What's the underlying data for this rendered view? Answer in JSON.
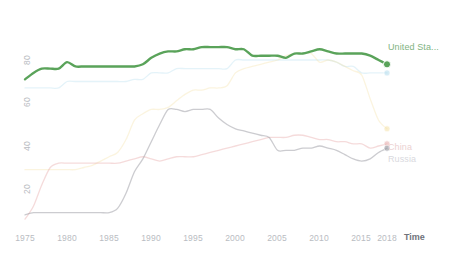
{
  "chart_data": {
    "type": "line",
    "title": "",
    "subtitle": "",
    "xlabel": "Time",
    "ylabel": "",
    "xlim": [
      1975,
      2018
    ],
    "ylim": [
      0,
      92
    ],
    "grid": false,
    "legend_position": "right",
    "x_ticks": [
      1975,
      1980,
      1985,
      1990,
      1995,
      2000,
      2005,
      2010,
      2015,
      2018
    ],
    "x_tick_labels": [
      "1975",
      "1980",
      "1985",
      "1990",
      "1995",
      "2000",
      "2005",
      "2010",
      "2015",
      "2018"
    ],
    "y_ticks": [
      20,
      40,
      60,
      80
    ],
    "y_tick_labels": [
      "20",
      "40",
      "60",
      "80"
    ],
    "x": [
      1975,
      1976,
      1977,
      1978,
      1979,
      1980,
      1981,
      1982,
      1983,
      1984,
      1985,
      1986,
      1987,
      1988,
      1989,
      1990,
      1991,
      1992,
      1993,
      1994,
      1995,
      1996,
      1997,
      1998,
      1999,
      2000,
      2001,
      2002,
      2003,
      2004,
      2005,
      2006,
      2007,
      2008,
      2009,
      2010,
      2011,
      2012,
      2013,
      2014,
      2015,
      2016,
      2017,
      2018
    ],
    "series": [
      {
        "name": "United Sta...",
        "full_name": "United States",
        "color": "#5aa35a",
        "opacity": 1,
        "highlighted": true,
        "end_value": 78,
        "values": [
          71,
          74,
          76,
          76,
          76,
          79,
          77,
          77,
          77,
          77,
          77,
          77,
          77,
          77,
          78,
          81,
          83,
          84,
          84,
          85,
          85,
          86,
          86,
          86,
          86,
          85,
          85,
          82,
          82,
          82,
          82,
          81,
          83,
          83,
          84,
          85,
          84,
          83,
          83,
          83,
          83,
          82,
          80,
          78
        ]
      },
      {
        "name": "",
        "full_name": "Japan",
        "color": "#9fd4e8",
        "opacity": 0.28,
        "highlighted": false,
        "end_value": 74,
        "values": [
          67,
          67,
          67,
          67,
          67,
          70,
          70,
          70,
          70,
          70,
          70,
          70,
          70,
          71,
          71,
          74,
          74,
          74,
          76,
          76,
          76,
          76,
          76,
          76,
          76,
          80,
          80,
          80,
          80,
          80,
          80,
          80,
          80,
          80,
          80,
          80,
          80,
          79,
          77,
          77,
          74,
          74,
          74,
          74
        ]
      },
      {
        "name": "",
        "full_name": "India",
        "color": "#f3dfa2",
        "opacity": 0.35,
        "highlighted": false,
        "end_value": 48,
        "values": [
          29,
          29,
          29,
          29,
          29,
          29,
          29,
          30,
          31,
          33,
          35,
          37,
          43,
          52,
          55,
          57,
          57,
          58,
          61,
          64,
          66,
          66,
          67,
          67,
          68,
          74,
          76,
          77,
          78,
          79,
          80,
          82,
          83,
          83,
          83,
          79,
          80,
          79,
          77,
          75,
          73,
          62,
          52,
          48
        ]
      },
      {
        "name": "China",
        "full_name": "China",
        "color": "#e8b0b0",
        "opacity": 0.45,
        "highlighted": false,
        "end_value": 41,
        "values": [
          6,
          12,
          22,
          30,
          32,
          32,
          32,
          32,
          32,
          32,
          32,
          32,
          33,
          34,
          35,
          34,
          33,
          34,
          35,
          35,
          35,
          36,
          37,
          38,
          39,
          40,
          41,
          42,
          43,
          44,
          44,
          44,
          45,
          45,
          44,
          43,
          43,
          42,
          42,
          41,
          41,
          39,
          40,
          41
        ]
      },
      {
        "name": "Russia",
        "full_name": "Russia",
        "color": "#9a9aa2",
        "opacity": 0.5,
        "highlighted": false,
        "end_value": 39,
        "values": [
          8,
          9,
          9,
          9,
          9,
          9,
          9,
          9,
          9,
          9,
          9,
          11,
          18,
          28,
          34,
          42,
          50,
          57,
          57,
          56,
          57,
          57,
          57,
          53,
          50,
          48,
          47,
          46,
          45,
          44,
          38,
          38,
          38,
          39,
          39,
          40,
          39,
          38,
          36,
          34,
          33,
          34,
          37,
          39
        ]
      }
    ]
  },
  "legend": {
    "items": [
      {
        "label": "United Sta...",
        "color": "#5aa35a",
        "text_color": "#7fb37f",
        "opacity": 1
      },
      {
        "label": "",
        "color": "#b8dcea",
        "text_color": "#cfe5ee",
        "opacity": 0.4
      },
      {
        "label": "",
        "color": "#f0dfb0",
        "text_color": "#f1e4c0",
        "opacity": 0.5
      },
      {
        "label": "China",
        "color": "#e8b0b0",
        "text_color": "#eccccc",
        "opacity": 0.6
      },
      {
        "label": "Russia",
        "color": "#9a9aa2",
        "text_color": "#d3d3d8",
        "opacity": 0.7
      }
    ]
  },
  "axes": {
    "x_axis_name": "Time",
    "y_axis_name": "",
    "x_tick_labels": [
      "1975",
      "1980",
      "1985",
      "1990",
      "1995",
      "2000",
      "2005",
      "2010",
      "2015",
      "2018"
    ],
    "y_tick_labels": [
      "80",
      "60",
      "40",
      "20"
    ]
  }
}
